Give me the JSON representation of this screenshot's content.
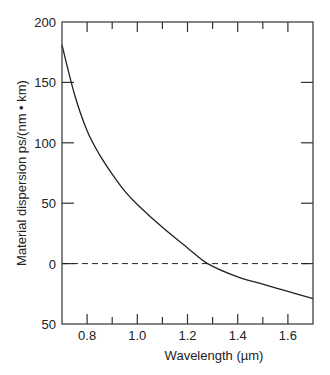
{
  "chart_data": {
    "type": "line",
    "title": "",
    "xlabel": "Wavelength (µm)",
    "ylabel": "Material dispersion ps/(nm • km)",
    "xlim": [
      0.7,
      1.7
    ],
    "ylim": [
      -50,
      200
    ],
    "x_ticks": [
      0.8,
      1.0,
      1.2,
      1.4,
      1.6
    ],
    "x_tick_labels": [
      "0.8",
      "1.0",
      "1.2",
      "1.4",
      "1.6"
    ],
    "x_minor_ticks": [
      0.9,
      1.1,
      1.3,
      1.5
    ],
    "y_ticks": [
      200,
      150,
      100,
      50,
      0,
      -50
    ],
    "y_tick_labels": [
      "200",
      "150",
      "100",
      "50",
      "0",
      "50"
    ],
    "grid": false,
    "legend": null,
    "series": [
      {
        "name": "Material dispersion",
        "style": "solid",
        "x": [
          0.7,
          0.75,
          0.8,
          0.85,
          0.9,
          0.95,
          1.0,
          1.1,
          1.2,
          1.28,
          1.4,
          1.5,
          1.6,
          1.7
        ],
        "values": [
          181,
          140,
          110,
          90,
          74,
          60,
          49,
          30,
          13,
          0,
          -11,
          -17,
          -23,
          -29
        ]
      },
      {
        "name": "Zero reference",
        "style": "dashed",
        "x": [
          0.7,
          1.7
        ],
        "values": [
          0,
          0
        ]
      }
    ],
    "annotations": [
      "Zero dispersion near 1.28 µm"
    ]
  }
}
